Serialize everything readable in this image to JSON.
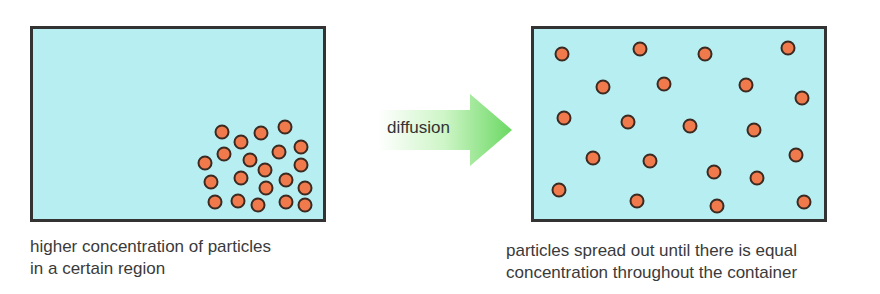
{
  "diagram": {
    "title": "Diffusion",
    "arrow_label": "diffusion",
    "left_caption_line1": "higher concentration of particles",
    "left_caption_line2": "in a certain region",
    "right_caption_line1": "particles spread out until there is equal",
    "right_caption_line2": "concentration throughout the container",
    "colors": {
      "container": "#b6eef2",
      "particle": "#f07a4c",
      "border": "#333333",
      "arrow": "#7ee07a"
    },
    "left_particles": [
      [
        222,
        132
      ],
      [
        241,
        142
      ],
      [
        261,
        133
      ],
      [
        285,
        127
      ],
      [
        224,
        154
      ],
      [
        250,
        160
      ],
      [
        279,
        152
      ],
      [
        301,
        147
      ],
      [
        205,
        163
      ],
      [
        265,
        170
      ],
      [
        301,
        165
      ],
      [
        211,
        182
      ],
      [
        241,
        178
      ],
      [
        266,
        188
      ],
      [
        286,
        180
      ],
      [
        305,
        188
      ],
      [
        215,
        202
      ],
      [
        238,
        201
      ],
      [
        258,
        205
      ],
      [
        286,
        202
      ],
      [
        305,
        205
      ]
    ],
    "right_particles": [
      [
        562,
        54
      ],
      [
        640,
        49
      ],
      [
        705,
        54
      ],
      [
        788,
        48
      ],
      [
        603,
        87
      ],
      [
        664,
        84
      ],
      [
        746,
        85
      ],
      [
        802,
        98
      ],
      [
        564,
        118
      ],
      [
        628,
        122
      ],
      [
        690,
        126
      ],
      [
        754,
        130
      ],
      [
        593,
        158
      ],
      [
        650,
        161
      ],
      [
        714,
        172
      ],
      [
        757,
        178
      ],
      [
        796,
        155
      ],
      [
        559,
        190
      ],
      [
        637,
        201
      ],
      [
        717,
        206
      ],
      [
        804,
        202
      ]
    ]
  }
}
